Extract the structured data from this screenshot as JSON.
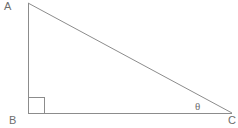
{
  "figure": {
    "kind": "geometry-diagram",
    "background_color": "#ffffff",
    "stroke_color": "#8c8c8c",
    "text_color": "#6e6e6e",
    "stroke_width": 1,
    "canvas": {
      "width": 238,
      "height": 128
    },
    "vertices": [
      {
        "id": "A",
        "label": "A",
        "x": 28,
        "y": 3
      },
      {
        "id": "B",
        "label": "B",
        "x": 28,
        "y": 113
      },
      {
        "id": "C",
        "label": "C",
        "x": 232,
        "y": 113
      }
    ],
    "edges": [
      {
        "id": "AB",
        "from": "A",
        "to": "B",
        "role": "vertical-leg"
      },
      {
        "id": "BC",
        "from": "B",
        "to": "C",
        "role": "horizontal-leg"
      },
      {
        "id": "AC",
        "from": "A",
        "to": "C",
        "role": "hypotenuse"
      }
    ],
    "right_angle_marker": {
      "at_vertex": "B",
      "size": 16,
      "x": 28,
      "y": 113
    },
    "angle_labels": [
      {
        "id": "theta",
        "label": "θ",
        "at_vertex": "C",
        "x": 199,
        "y": 107
      }
    ]
  }
}
